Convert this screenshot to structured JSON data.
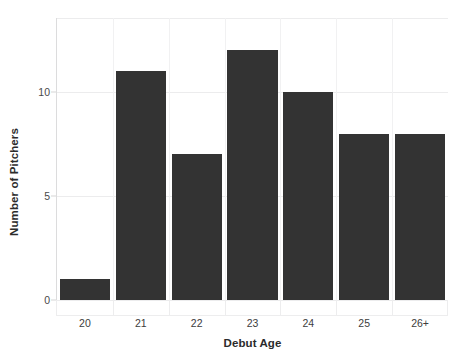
{
  "chart_data": {
    "type": "bar",
    "title": "",
    "subtitle": "",
    "xlabel": "Debut Age",
    "ylabel": "Number of Pitchers",
    "categories": [
      "20",
      "21",
      "22",
      "23",
      "24",
      "25",
      "26+"
    ],
    "values": [
      1,
      11,
      7,
      12,
      10,
      8,
      8
    ],
    "series": [
      {
        "name": "Number of Pitchers",
        "values": [
          1,
          11,
          7,
          12,
          10,
          8,
          8
        ]
      }
    ],
    "ylim": [
      0,
      13.55
    ],
    "yticks": [
      0,
      5,
      10
    ],
    "ytick_labels": [
      "0",
      "5",
      "10"
    ],
    "xtick_labels": [
      "20",
      "21",
      "22",
      "23",
      "24",
      "25",
      "26+"
    ],
    "grid": "horizontal-and-vertical-light",
    "legend": "none",
    "bar_color": "#333333",
    "grid_color": "#ececed",
    "axis_color": "#cfcfd0",
    "background_color": "#ffffff",
    "annotations": []
  },
  "axes": {
    "y_title": "Number of Pitchers",
    "x_title": "Debut Age"
  }
}
